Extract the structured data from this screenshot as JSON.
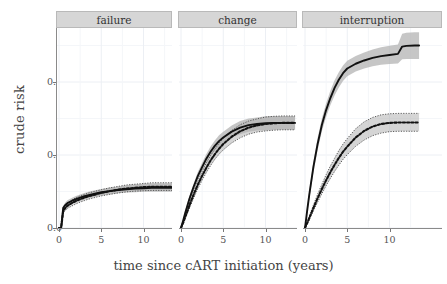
{
  "figure": {
    "ylabel": "crude risk",
    "xlabel": "time since cART initiation (years)",
    "background": "#ffffff",
    "strip_fill": "#d6d6d6",
    "grid_color": "#eceff4",
    "band_color": "#b3b3b3",
    "line_color": "#111111"
  },
  "axes": {
    "y_ticks": [
      "0.0",
      "0.2",
      "0.4"
    ],
    "y_values": [
      0.0,
      0.2,
      0.4
    ],
    "x_ticks": [
      "0",
      "5",
      "10"
    ],
    "x_values": [
      0,
      5,
      10
    ]
  },
  "chart_data": {
    "type": "line",
    "title": "",
    "xlabel": "time since cART initiation (years)",
    "ylabel": "crude risk",
    "xlim": [
      0,
      13.5
    ],
    "ylim": [
      0.0,
      0.55
    ],
    "xticks": [
      0,
      5,
      10
    ],
    "yticks": [
      0.0,
      0.2,
      0.4
    ],
    "grid": true,
    "legend": "none",
    "facets": [
      {
        "label": "failure",
        "x": [
          0,
          0.25,
          0.5,
          0.75,
          1,
          1.5,
          2,
          2.5,
          3,
          3.5,
          4,
          5,
          6,
          7,
          8,
          9,
          10,
          11,
          12,
          13,
          13.5
        ],
        "series": [
          {
            "name": "solid",
            "style": "solid",
            "values": [
              0.0,
              0.0,
              0.055,
              0.063,
              0.068,
              0.074,
              0.079,
              0.083,
              0.087,
              0.09,
              0.093,
              0.098,
              0.101,
              0.104,
              0.106,
              0.108,
              0.109,
              0.11,
              0.11,
              0.11,
              0.11
            ],
            "ci_lower": [
              0.0,
              0.0,
              0.049,
              0.056,
              0.061,
              0.066,
              0.071,
              0.075,
              0.079,
              0.082,
              0.085,
              0.09,
              0.092,
              0.095,
              0.097,
              0.098,
              0.099,
              0.099,
              0.099,
              0.099,
              0.099
            ],
            "ci_upper": [
              0.0,
              0.0,
              0.061,
              0.07,
              0.076,
              0.082,
              0.088,
              0.092,
              0.096,
              0.099,
              0.102,
              0.107,
              0.111,
              0.114,
              0.117,
              0.119,
              0.121,
              0.122,
              0.122,
              0.122,
              0.122
            ]
          },
          {
            "name": "dotted",
            "style": "dotted",
            "values": [
              0.0,
              0.0,
              0.047,
              0.055,
              0.061,
              0.068,
              0.074,
              0.079,
              0.083,
              0.087,
              0.09,
              0.096,
              0.101,
              0.105,
              0.108,
              0.11,
              0.112,
              0.113,
              0.113,
              0.113,
              0.113
            ],
            "ci_lower": [
              0.0,
              0.0,
              0.041,
              0.048,
              0.054,
              0.06,
              0.066,
              0.071,
              0.075,
              0.079,
              0.082,
              0.088,
              0.092,
              0.096,
              0.099,
              0.101,
              0.102,
              0.103,
              0.103,
              0.103,
              0.103
            ],
            "ci_upper": [
              0.0,
              0.0,
              0.053,
              0.062,
              0.069,
              0.076,
              0.083,
              0.088,
              0.092,
              0.096,
              0.099,
              0.105,
              0.11,
              0.114,
              0.118,
              0.12,
              0.122,
              0.124,
              0.124,
              0.124,
              0.124
            ]
          }
        ]
      },
      {
        "label": "change",
        "x": [
          0,
          0.25,
          0.5,
          1,
          1.5,
          2,
          2.5,
          3,
          3.5,
          4,
          4.5,
          5,
          6,
          7,
          8,
          9,
          10,
          11,
          12,
          13,
          13.5
        ],
        "series": [
          {
            "name": "solid",
            "style": "solid",
            "values": [
              0.0,
              0.02,
              0.041,
              0.08,
              0.113,
              0.143,
              0.167,
              0.19,
              0.209,
              0.225,
              0.238,
              0.248,
              0.264,
              0.275,
              0.282,
              0.285,
              0.287,
              0.288,
              0.288,
              0.288,
              0.288
            ],
            "ci_lower": [
              0.0,
              0.016,
              0.035,
              0.072,
              0.104,
              0.132,
              0.155,
              0.177,
              0.195,
              0.21,
              0.222,
              0.232,
              0.247,
              0.257,
              0.264,
              0.267,
              0.268,
              0.269,
              0.269,
              0.269,
              0.269
            ],
            "ci_upper": [
              0.0,
              0.024,
              0.047,
              0.088,
              0.122,
              0.154,
              0.179,
              0.203,
              0.223,
              0.24,
              0.254,
              0.264,
              0.281,
              0.293,
              0.3,
              0.303,
              0.306,
              0.307,
              0.307,
              0.307,
              0.307
            ]
          },
          {
            "name": "dotted",
            "style": "dotted",
            "values": [
              0.0,
              0.014,
              0.03,
              0.062,
              0.092,
              0.119,
              0.143,
              0.165,
              0.185,
              0.202,
              0.217,
              0.23,
              0.25,
              0.265,
              0.275,
              0.281,
              0.285,
              0.287,
              0.288,
              0.288,
              0.288
            ],
            "ci_lower": [
              0.0,
              0.011,
              0.025,
              0.054,
              0.082,
              0.108,
              0.131,
              0.152,
              0.171,
              0.188,
              0.202,
              0.214,
              0.233,
              0.247,
              0.257,
              0.263,
              0.266,
              0.268,
              0.269,
              0.269,
              0.269
            ],
            "ci_upper": [
              0.0,
              0.017,
              0.035,
              0.07,
              0.102,
              0.13,
              0.155,
              0.178,
              0.199,
              0.216,
              0.232,
              0.246,
              0.267,
              0.283,
              0.293,
              0.299,
              0.304,
              0.306,
              0.307,
              0.307,
              0.307
            ]
          }
        ]
      },
      {
        "label": "interruption",
        "x": [
          0,
          0.25,
          0.5,
          1,
          1.5,
          2,
          2.5,
          3,
          3.5,
          4,
          4.5,
          5,
          6,
          7,
          8,
          9,
          10,
          11,
          11.5,
          12,
          13,
          13.5
        ],
        "series": [
          {
            "name": "solid",
            "style": "solid",
            "values": [
              0.0,
              0.046,
              0.09,
              0.168,
              0.231,
              0.283,
              0.323,
              0.356,
              0.384,
              0.406,
              0.424,
              0.437,
              0.45,
              0.459,
              0.466,
              0.471,
              0.474,
              0.477,
              0.497,
              0.499,
              0.5,
              0.5
            ],
            "ci_lower": [
              0.0,
              0.038,
              0.079,
              0.153,
              0.214,
              0.265,
              0.304,
              0.336,
              0.363,
              0.385,
              0.403,
              0.416,
              0.429,
              0.437,
              0.443,
              0.447,
              0.449,
              0.451,
              0.462,
              0.463,
              0.463,
              0.463
            ],
            "ci_upper": [
              0.0,
              0.054,
              0.101,
              0.183,
              0.248,
              0.301,
              0.342,
              0.376,
              0.405,
              0.427,
              0.445,
              0.458,
              0.471,
              0.481,
              0.489,
              0.495,
              0.499,
              0.503,
              0.532,
              0.535,
              0.536,
              0.536
            ]
          },
          {
            "name": "dotted",
            "style": "dotted",
            "values": [
              0.0,
              0.013,
              0.027,
              0.055,
              0.082,
              0.107,
              0.131,
              0.153,
              0.173,
              0.192,
              0.209,
              0.223,
              0.248,
              0.266,
              0.278,
              0.285,
              0.288,
              0.289,
              0.289,
              0.289,
              0.289,
              0.289
            ],
            "ci_lower": [
              0.0,
              0.01,
              0.022,
              0.047,
              0.071,
              0.094,
              0.116,
              0.136,
              0.155,
              0.172,
              0.188,
              0.201,
              0.224,
              0.241,
              0.253,
              0.26,
              0.264,
              0.265,
              0.265,
              0.265,
              0.265,
              0.265
            ],
            "ci_upper": [
              0.0,
              0.016,
              0.032,
              0.063,
              0.093,
              0.12,
              0.146,
              0.17,
              0.191,
              0.212,
              0.23,
              0.245,
              0.272,
              0.291,
              0.303,
              0.31,
              0.313,
              0.314,
              0.314,
              0.314,
              0.314,
              0.314
            ]
          }
        ]
      }
    ]
  }
}
